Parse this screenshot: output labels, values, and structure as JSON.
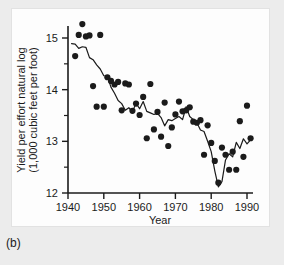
{
  "figure": {
    "caption": "(b)",
    "panel_background": "#fdfdfd",
    "page_background": "#ececec",
    "ink_color": "#1b1b1b"
  },
  "chart_data": {
    "type": "scatter",
    "title": "",
    "subtitle": "",
    "xlabel": "Year",
    "ylabel": "Yield per effort natural log (1,000 cubic feet per foot)",
    "ylabel_line1": "Yield per effort natural log",
    "ylabel_line2": "(1,000 cubic feet per foot)",
    "xlim": [
      1939,
      1992
    ],
    "ylim": [
      11.85,
      15.45
    ],
    "xticks": [
      1940,
      1950,
      1960,
      1970,
      1980,
      1990
    ],
    "xtick_labels": [
      "1940",
      "1950",
      "1960",
      "1970",
      "1980",
      "1990"
    ],
    "yticks": [
      12,
      13,
      14,
      15
    ],
    "ytick_labels": [
      "12",
      "13",
      "14",
      "15"
    ],
    "yminor_ticks": [
      12.5,
      13.5,
      14.5
    ],
    "grid": false,
    "legend": "none",
    "series": [
      {
        "name": "Annual yield per effort",
        "type": "scatter",
        "marker": "filled-circle",
        "marker_color": "#1b1b1b",
        "marker_size": 3.1,
        "x": [
          1942,
          1943,
          1944,
          1945,
          1946,
          1947,
          1948,
          1949,
          1950,
          1951,
          1952,
          1953,
          1954,
          1955,
          1956,
          1957,
          1958,
          1959,
          1960,
          1961,
          1962,
          1963,
          1964,
          1965,
          1966,
          1967,
          1968,
          1969,
          1970,
          1971,
          1972,
          1973,
          1974,
          1975,
          1976,
          1977,
          1978,
          1979,
          1980,
          1981,
          1982,
          1983,
          1984,
          1985,
          1986,
          1987,
          1988,
          1989,
          1990,
          1991
        ],
        "y": [
          14.65,
          15.06,
          15.27,
          15.03,
          15.05,
          14.07,
          13.67,
          15.06,
          13.67,
          14.24,
          14.17,
          14.1,
          14.15,
          13.6,
          14.12,
          14.1,
          13.59,
          13.73,
          13.51,
          13.86,
          13.06,
          14.11,
          13.23,
          13.57,
          13.09,
          13.75,
          12.91,
          13.27,
          13.52,
          13.77,
          13.58,
          13.6,
          13.66,
          13.38,
          13.36,
          13.41,
          12.74,
          13.31,
          12.97,
          12.62,
          12.2,
          12.88,
          12.74,
          12.45,
          12.8,
          12.45,
          13.39,
          12.7,
          13.69,
          13.06
        ]
      },
      {
        "name": "Smoothed trend",
        "type": "line",
        "line_color": "#1b1b1b",
        "line_width": 1.2,
        "x": [
          1941,
          1942,
          1943,
          1944,
          1945,
          1946,
          1947,
          1948,
          1949,
          1950,
          1951,
          1952,
          1953,
          1954,
          1955,
          1956,
          1957,
          1958,
          1959,
          1960,
          1961,
          1962,
          1963,
          1964,
          1965,
          1966,
          1967,
          1968,
          1969,
          1970,
          1971,
          1972,
          1973,
          1974,
          1975,
          1976,
          1977,
          1978,
          1979,
          1980,
          1981,
          1982,
          1983,
          1984,
          1985,
          1986,
          1987,
          1988,
          1989,
          1990,
          1991
        ],
        "y": [
          14.89,
          14.88,
          14.8,
          14.83,
          14.82,
          14.62,
          14.58,
          14.48,
          14.4,
          14.27,
          14.26,
          14.05,
          13.93,
          13.79,
          13.73,
          13.6,
          13.65,
          13.57,
          13.74,
          13.63,
          13.77,
          13.58,
          13.55,
          13.52,
          13.54,
          13.46,
          13.3,
          13.42,
          13.4,
          13.44,
          13.48,
          13.42,
          13.67,
          13.48,
          13.42,
          13.36,
          13.22,
          13.19,
          13.0,
          12.8,
          12.43,
          12.12,
          12.22,
          12.64,
          12.76,
          12.7,
          12.98,
          12.86,
          13.05,
          12.95,
          13.03
        ]
      }
    ]
  }
}
